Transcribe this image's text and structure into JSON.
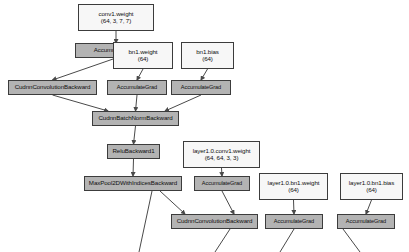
{
  "diagram": {
    "type": "directed-graph",
    "background_color": "#ffffff",
    "op_node_color": "#b3b3b3",
    "param_node_color": "#f7f7f7",
    "border_color": "#3c3c3c",
    "edge_color": "#4a4a4a",
    "nodes": [
      {
        "id": "conv1_weight",
        "kind": "param",
        "label": "conv1.weight",
        "shape": "(64, 3, 7, 7)",
        "x": 78,
        "y": 4,
        "w": 76,
        "h": 27,
        "font": 6.2
      },
      {
        "id": "accgrad_conv1",
        "kind": "op",
        "label": "AccumulateGrad",
        "shape": "",
        "x": 75,
        "y": 43,
        "w": 82,
        "h": 15,
        "font": 6.2
      },
      {
        "id": "bn1_weight",
        "kind": "param",
        "label": "bn1.weight",
        "shape": "(64)",
        "x": 113,
        "y": 42,
        "w": 60,
        "h": 27,
        "font": 6.2
      },
      {
        "id": "bn1_bias",
        "kind": "param",
        "label": "bn1.bias",
        "shape": "(64)",
        "x": 181,
        "y": 42,
        "w": 53,
        "h": 27,
        "font": 6.2
      },
      {
        "id": "cudnn_conv_bwd_1",
        "kind": "op",
        "label": "CudnnConvolutionBackward",
        "shape": "",
        "x": 8,
        "y": 80,
        "w": 89,
        "h": 15,
        "font": 6.2
      },
      {
        "id": "accgrad_bn1_w",
        "kind": "op",
        "label": "AccumulateGrad",
        "shape": "",
        "x": 107,
        "y": 80,
        "w": 60,
        "h": 15,
        "font": 5.6
      },
      {
        "id": "accgrad_bn1_b",
        "kind": "op",
        "label": "AccumulateGrad",
        "shape": "",
        "x": 171,
        "y": 80,
        "w": 60,
        "h": 15,
        "font": 5.6
      },
      {
        "id": "cudnn_bn_bwd",
        "kind": "op",
        "label": "CudnnBatchNormBackward",
        "shape": "",
        "x": 92,
        "y": 111,
        "w": 87,
        "h": 15,
        "font": 6.2
      },
      {
        "id": "relu_bwd",
        "kind": "op",
        "label": "ReluBackward1",
        "shape": "",
        "x": 107,
        "y": 144,
        "w": 53,
        "h": 15,
        "font": 6.2
      },
      {
        "id": "layer1_conv1_weight",
        "kind": "param",
        "label": "layer1.0.conv1.weight",
        "shape": "(64, 64, 3, 3)",
        "x": 183,
        "y": 141,
        "w": 77,
        "h": 27,
        "font": 6.2
      },
      {
        "id": "maxpool_bwd",
        "kind": "op",
        "label": "MaxPool2DWithIndicesBackward",
        "shape": "",
        "x": 84,
        "y": 176,
        "w": 98,
        "h": 15,
        "font": 6.2
      },
      {
        "id": "accgrad_layer1_conv1",
        "kind": "op",
        "label": "AccumulateGrad",
        "shape": "",
        "x": 194,
        "y": 176,
        "w": 56,
        "h": 15,
        "font": 5.6
      },
      {
        "id": "layer1_bn1_weight",
        "kind": "param",
        "label": "layer1.0.bn1.weight",
        "shape": "(64)",
        "x": 259,
        "y": 173,
        "w": 69,
        "h": 27,
        "font": 6.2
      },
      {
        "id": "layer1_bn1_bias",
        "kind": "param",
        "label": "layer1.0.bn1.bias",
        "shape": "(64)",
        "x": 340,
        "y": 173,
        "w": 63,
        "h": 27,
        "font": 6.2
      },
      {
        "id": "cudnn_conv_bwd_2",
        "kind": "op",
        "label": "CudnnConvolutionBackward",
        "shape": "",
        "x": 171,
        "y": 214,
        "w": 87,
        "h": 15,
        "font": 6.2
      },
      {
        "id": "accgrad_layer1_bn1_w",
        "kind": "op",
        "label": "AccumulateGrad",
        "shape": "",
        "x": 265,
        "y": 214,
        "w": 58,
        "h": 15,
        "font": 5.6
      },
      {
        "id": "accgrad_layer1_bn1_b",
        "kind": "op",
        "label": "AccumulateGrad",
        "shape": "",
        "x": 337,
        "y": 214,
        "w": 58,
        "h": 15,
        "font": 5.6
      }
    ],
    "edges": [
      {
        "from": "conv1_weight",
        "to": "accgrad_conv1"
      },
      {
        "from": "accgrad_conv1",
        "to": "cudnn_conv_bwd_1"
      },
      {
        "from": "bn1_weight",
        "to": "accgrad_bn1_w"
      },
      {
        "from": "bn1_bias",
        "to": "accgrad_bn1_b"
      },
      {
        "from": "cudnn_conv_bwd_1",
        "to": "cudnn_bn_bwd"
      },
      {
        "from": "accgrad_bn1_w",
        "to": "cudnn_bn_bwd"
      },
      {
        "from": "accgrad_bn1_b",
        "to": "cudnn_bn_bwd"
      },
      {
        "from": "cudnn_bn_bwd",
        "to": "relu_bwd"
      },
      {
        "from": "relu_bwd",
        "to": "maxpool_bwd"
      },
      {
        "from": "layer1_conv1_weight",
        "to": "accgrad_layer1_conv1"
      },
      {
        "from": "maxpool_bwd",
        "to": "cudnn_conv_bwd_2"
      },
      {
        "from": "accgrad_layer1_conv1",
        "to": "cudnn_conv_bwd_2"
      },
      {
        "from": "layer1_bn1_weight",
        "to": "accgrad_layer1_bn1_w"
      },
      {
        "from": "layer1_bn1_bias",
        "to": "accgrad_layer1_bn1_b"
      },
      {
        "from": "maxpool_bwd",
        "to": "below_1"
      },
      {
        "from": "cudnn_conv_bwd_2",
        "to": "below_2"
      },
      {
        "from": "accgrad_layer1_bn1_w",
        "to": "below_3"
      },
      {
        "from": "accgrad_layer1_bn1_b",
        "to": "below_4"
      }
    ]
  }
}
